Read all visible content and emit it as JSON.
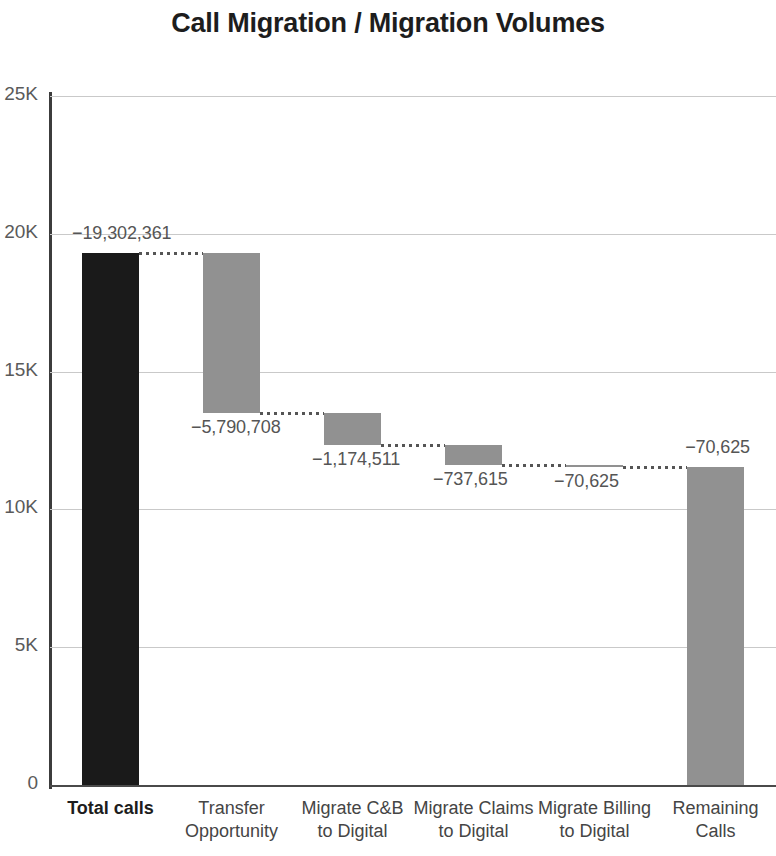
{
  "chart_data": {
    "type": "bar",
    "subtype": "waterfall",
    "title": "Call Migration / Migration Volumes",
    "xlabel": "",
    "ylabel": "",
    "ylim": [
      0,
      25000000
    ],
    "ytick_labels": [
      "0",
      "5K",
      "10K",
      "15K",
      "20K",
      "25K"
    ],
    "ytick_values": [
      0,
      5000000,
      10000000,
      15000000,
      20000000,
      25000000
    ],
    "grid": true,
    "legend": "none",
    "categories": [
      "Total calls",
      "Transfer\nOpportunity",
      "Migrate C&B\nto Digital",
      "Migrate Claims\nto Digital",
      "Migrate Billing\nto Digital",
      "Remaining\nCalls"
    ],
    "values": [
      19302361,
      -5790708,
      -1174511,
      -737615,
      -70625,
      11528902
    ],
    "data_labels": [
      "−19,302,361",
      "−5,790,708",
      "−1,174,511",
      "−737,615",
      "−70,625",
      "−70,625"
    ],
    "bars": [
      {
        "label": "Total calls",
        "data_label": "−19,302,361",
        "top_value": 19302361,
        "bottom_value": 0,
        "kind": "total",
        "color": "#1a1a1a"
      },
      {
        "label": "Transfer Opportunity",
        "data_label": "−5,790,708",
        "top_value": 19302361,
        "bottom_value": 13511653,
        "kind": "delta",
        "color": "#919191"
      },
      {
        "label": "Migrate C&B to Digital",
        "data_label": "−1,174,511",
        "top_value": 13511653,
        "bottom_value": 12337142,
        "kind": "delta",
        "color": "#919191"
      },
      {
        "label": "Migrate Claims to Digital",
        "data_label": "−737,615",
        "top_value": 12337142,
        "bottom_value": 11599527,
        "kind": "delta",
        "color": "#919191"
      },
      {
        "label": "Migrate Billing to Digital",
        "data_label": "−70,625",
        "top_value": 11599527,
        "bottom_value": 11528902,
        "kind": "delta",
        "color": "#919191"
      },
      {
        "label": "Remaining Calls",
        "data_label": "−70,625",
        "top_value": 11528902,
        "bottom_value": 0,
        "kind": "total",
        "color": "#919191"
      }
    ],
    "colors": {
      "total_bar": "#1a1a1a",
      "delta_bar": "#919191",
      "gridline": "#c9c9c9",
      "axis": "#3c3c3c",
      "connector": "#555555",
      "label_text": "#555555",
      "title_text": "#1d1d1d"
    }
  }
}
